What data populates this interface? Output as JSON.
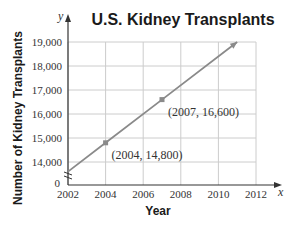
{
  "chart_data": {
    "type": "line",
    "title": "U.S. Kidney Transplants",
    "xlabel": "Year",
    "ylabel": "Number of Kidney Transplants",
    "x_axis_var": "x",
    "y_axis_var": "y",
    "x_ticks": [
      "2002",
      "2004",
      "2006",
      "2008",
      "2010",
      "2012"
    ],
    "y_ticks": [
      "19,000",
      "18,000",
      "17,000",
      "16,000",
      "15,000",
      "14,000"
    ],
    "y_origin_label": "0",
    "xlim": [
      2002,
      2012
    ],
    "ylim": [
      13200,
      19000
    ],
    "y_axis_break": true,
    "grid": true,
    "series": [
      {
        "name": "Kidney transplants",
        "x": [
          2002,
          2004,
          2007,
          2011
        ],
        "y": [
          13600,
          14800,
          16600,
          19000
        ],
        "color": "#8a8a8a"
      }
    ],
    "points": [
      {
        "x": 2004,
        "y": 14800,
        "label": "(2004, 14,800)"
      },
      {
        "x": 2007,
        "y": 16600,
        "label": "(2007, 16,600)"
      }
    ]
  },
  "colors": {
    "line": "#8a8a8a",
    "grid": "#cccccc",
    "axis": "#333333",
    "text": "#1a1a1a"
  }
}
